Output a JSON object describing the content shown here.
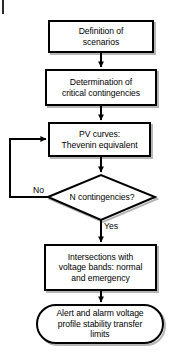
{
  "diagram": {
    "background_color": "#ffffff",
    "stroke_color": "#000000",
    "shadow_color": "#b5b5b5",
    "nodes": [
      {
        "id": "definition-of-scenarios",
        "shape": "process",
        "text": "Definition of\nscenarios"
      },
      {
        "id": "determination-of-critical-contingencies",
        "shape": "process",
        "text": "Determination of\ncritical contingencies"
      },
      {
        "id": "pv-curves-thevenin-equivalent",
        "shape": "process",
        "text": "PV curves:\nThevenin equivalent"
      },
      {
        "id": "n-contingencies-decision",
        "shape": "decision",
        "text": "N contingencies?"
      },
      {
        "id": "intersections-with-voltage-bands",
        "shape": "process",
        "text": "Intersections with\nvoltage bands: normal\nand emergency"
      },
      {
        "id": "alert-and-alarm-limits",
        "shape": "terminal",
        "text": "Alert and alarm voltage\nprofile stability transfer\nlimits"
      }
    ],
    "edge_labels": [
      {
        "id": "no-branch-label",
        "text": "No"
      },
      {
        "id": "yes-branch-label",
        "text": "Yes"
      }
    ]
  }
}
